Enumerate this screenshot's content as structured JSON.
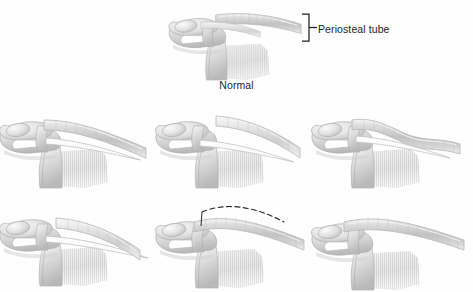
{
  "figure": {
    "background_color": "#fefefe",
    "ink_color": "#1c1c1c",
    "shade_light": "#e8e8e8",
    "shade_mid": "#c9c9c9",
    "shade_dark": "#9a9a9a",
    "outline_color": "#b5b5b5"
  },
  "labels": {
    "periosteal_tube": "Periosteal tube",
    "normal": "Normal"
  },
  "callout": {
    "bracket_name": "square-bracket",
    "leader_name": "leader-line"
  },
  "panels": [
    {
      "id": "normal",
      "row": 0,
      "column": 1,
      "caption": "Normal",
      "has_dashed_overlay": false,
      "description": "Intact clavicle with continuous periosteal tube extending laterally"
    },
    {
      "id": "variant-1",
      "row": 1,
      "column": 0,
      "caption": "",
      "has_dashed_overlay": false,
      "description": "Periosteal tube split, lateral fragment displaced superiorly"
    },
    {
      "id": "variant-2",
      "row": 1,
      "column": 1,
      "caption": "",
      "has_dashed_overlay": false,
      "description": "Periosteal tube separated with free lateral segment angled upward"
    },
    {
      "id": "variant-3",
      "row": 1,
      "column": 2,
      "caption": "",
      "has_dashed_overlay": false,
      "description": "Periosteal tube with wavy lateral continuation, mild displacement"
    },
    {
      "id": "variant-4",
      "row": 2,
      "column": 0,
      "caption": "",
      "has_dashed_overlay": false,
      "description": "Detached lateral tube segment lying above thin periosteal strand"
    },
    {
      "id": "variant-5",
      "row": 2,
      "column": 1,
      "caption": "",
      "has_dashed_overlay": true,
      "description": "Reduced tube with dashed outline indicating prior displaced position"
    },
    {
      "id": "variant-6",
      "row": 2,
      "column": 2,
      "caption": "",
      "has_dashed_overlay": false,
      "description": "Restored continuous periosteal tube after reduction"
    }
  ]
}
